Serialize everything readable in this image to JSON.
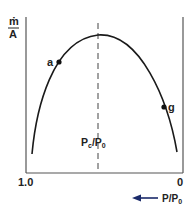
{
  "diagram": {
    "y_axis_label": {
      "numerator": "ṁ",
      "denominator": "A"
    },
    "x_axis": {
      "left_tick": "1.0",
      "right_tick": "0",
      "direction_label": "P/P",
      "direction_label_sub": "0",
      "direction": "right-to-left"
    },
    "critical_line_label": {
      "p": "P",
      "c": "c",
      "sep": "/P",
      "zero": "0"
    },
    "points": [
      {
        "label": "a",
        "x": 59,
        "y": 62
      },
      {
        "label": "g",
        "x": 164,
        "y": 107
      }
    ],
    "curve": {
      "shape": "inverted parabola",
      "peak_at": "Pc/P0"
    },
    "colors": {
      "line": "#1a1a1a",
      "axis": "#555555",
      "background": "#ffffff"
    }
  }
}
